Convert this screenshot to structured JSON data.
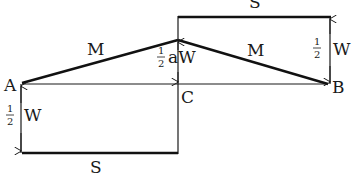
{
  "diagram": {
    "type": "shear and bending moment diagram",
    "points": {
      "A": "A",
      "B": "B",
      "C": "C"
    },
    "labels": {
      "moment_left": "M",
      "moment_right": "M",
      "shear_top": "S",
      "shear_bottom": "S",
      "apex_value_num": "1",
      "apex_value_den": "2",
      "apex_value_suffix": "aW",
      "left_value_num": "1",
      "left_value_den": "2",
      "left_value_suffix": "W",
      "right_value_num": "1",
      "right_value_den": "2",
      "right_value_suffix": "W"
    },
    "colors": {
      "line": "#1a1a1a",
      "background": "#ffffff"
    }
  }
}
